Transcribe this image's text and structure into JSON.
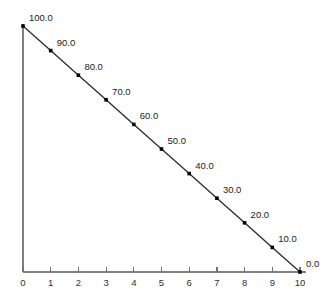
{
  "chart_data": {
    "type": "line",
    "title": "",
    "subtitle": "",
    "xlabel": "",
    "ylabel": "",
    "x": [
      0,
      1,
      2,
      3,
      4,
      5,
      6,
      7,
      8,
      9,
      10
    ],
    "values": [
      100.0,
      90.0,
      80.0,
      70.0,
      60.0,
      50.0,
      40.0,
      30.0,
      20.0,
      10.0,
      0.0
    ],
    "point_labels": [
      "100.0",
      "90.0",
      "80.0",
      "70.0",
      "60.0",
      "50.0",
      "40.0",
      "30.0",
      "20.0",
      "10.0",
      "0.0"
    ],
    "xticks": [
      0,
      1,
      2,
      3,
      4,
      5,
      6,
      7,
      8,
      9,
      10
    ],
    "xtick_labels": [
      "0",
      "1",
      "2",
      "3",
      "4",
      "5",
      "6",
      "7",
      "8",
      "9",
      "10"
    ],
    "yticks": [],
    "ytick_labels": [],
    "xlim": [
      0,
      10
    ],
    "ylim": [
      0,
      100
    ],
    "grid": false,
    "legend": null,
    "marker": "square",
    "colors": {
      "background": "#ffffff",
      "axis": "#808080",
      "line": "#2b2b2b",
      "marker": "#000000",
      "text": "#1a1a1a"
    }
  }
}
